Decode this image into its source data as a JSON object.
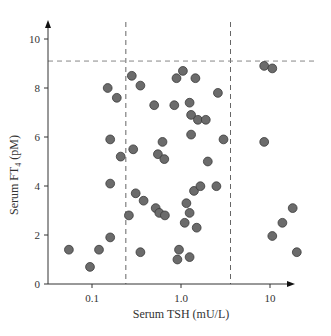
{
  "chart_data": {
    "type": "scatter",
    "title": "",
    "xlabel": "Serum TSH (mU/L)",
    "ylabel_main": "Serum FT",
    "ylabel_sub": "4",
    "ylabel_unit": " (pM)",
    "xscale": "log",
    "xlim": [
      0.03,
      25
    ],
    "ylim": [
      0,
      10.6
    ],
    "xticks": [
      {
        "value": 0.1,
        "label": "0.1"
      },
      {
        "value": 1.0,
        "label": "1.0"
      },
      {
        "value": 10,
        "label": "10"
      }
    ],
    "yticks": [
      {
        "value": 0,
        "label": "0"
      },
      {
        "value": 2,
        "label": "2"
      },
      {
        "value": 4,
        "label": "4"
      },
      {
        "value": 6,
        "label": "6"
      },
      {
        "value": 8,
        "label": "8"
      },
      {
        "value": 10,
        "label": "10"
      }
    ],
    "reference_lines": {
      "vertical_dashed_x": [
        0.24,
        3.6
      ],
      "horizontal_dashed_y": [
        9.1
      ]
    },
    "grid": false,
    "legend": null,
    "marker_color": "#6b6b6b",
    "marker_edge": "#3a3a3a",
    "points": [
      {
        "x": 0.055,
        "y": 1.4
      },
      {
        "x": 0.095,
        "y": 0.7
      },
      {
        "x": 0.12,
        "y": 1.4
      },
      {
        "x": 0.16,
        "y": 1.9
      },
      {
        "x": 0.16,
        "y": 4.1
      },
      {
        "x": 0.15,
        "y": 8.0
      },
      {
        "x": 0.19,
        "y": 7.6
      },
      {
        "x": 0.16,
        "y": 5.9
      },
      {
        "x": 0.21,
        "y": 5.2
      },
      {
        "x": 0.28,
        "y": 8.5
      },
      {
        "x": 0.35,
        "y": 8.1
      },
      {
        "x": 0.29,
        "y": 5.5
      },
      {
        "x": 0.26,
        "y": 2.8
      },
      {
        "x": 0.31,
        "y": 3.7
      },
      {
        "x": 0.38,
        "y": 3.4
      },
      {
        "x": 0.35,
        "y": 1.3
      },
      {
        "x": 0.5,
        "y": 7.3
      },
      {
        "x": 0.62,
        "y": 5.8
      },
      {
        "x": 0.55,
        "y": 5.3
      },
      {
        "x": 0.65,
        "y": 5.1
      },
      {
        "x": 0.52,
        "y": 3.1
      },
      {
        "x": 0.57,
        "y": 2.9
      },
      {
        "x": 0.66,
        "y": 2.8
      },
      {
        "x": 0.84,
        "y": 7.3
      },
      {
        "x": 0.89,
        "y": 8.4
      },
      {
        "x": 1.05,
        "y": 8.7
      },
      {
        "x": 1.45,
        "y": 8.4
      },
      {
        "x": 1.25,
        "y": 7.4
      },
      {
        "x": 1.3,
        "y": 6.9
      },
      {
        "x": 1.55,
        "y": 6.7
      },
      {
        "x": 1.9,
        "y": 6.7
      },
      {
        "x": 1.3,
        "y": 6.1
      },
      {
        "x": 2.6,
        "y": 7.8
      },
      {
        "x": 3.0,
        "y": 5.9
      },
      {
        "x": 2.0,
        "y": 5.0
      },
      {
        "x": 1.4,
        "y": 3.8
      },
      {
        "x": 1.65,
        "y": 3.99
      },
      {
        "x": 2.5,
        "y": 3.99
      },
      {
        "x": 1.15,
        "y": 3.3
      },
      {
        "x": 1.25,
        "y": 2.9
      },
      {
        "x": 1.1,
        "y": 2.5
      },
      {
        "x": 1.5,
        "y": 2.3
      },
      {
        "x": 0.95,
        "y": 1.4
      },
      {
        "x": 0.91,
        "y": 1.0
      },
      {
        "x": 1.25,
        "y": 1.1
      },
      {
        "x": 8.6,
        "y": 8.9
      },
      {
        "x": 10.6,
        "y": 8.8
      },
      {
        "x": 8.6,
        "y": 5.8
      },
      {
        "x": 18.0,
        "y": 3.1
      },
      {
        "x": 13.8,
        "y": 2.5
      },
      {
        "x": 10.6,
        "y": 1.96
      },
      {
        "x": 20.0,
        "y": 1.3
      }
    ]
  },
  "layout": {
    "origin_px": [
      48,
      284
    ],
    "x_decade_px": 89,
    "x_at_1_px": 181,
    "y_unit_px": 24.5,
    "x_axis_end_px": 295,
    "y_axis_top_px": 20
  }
}
